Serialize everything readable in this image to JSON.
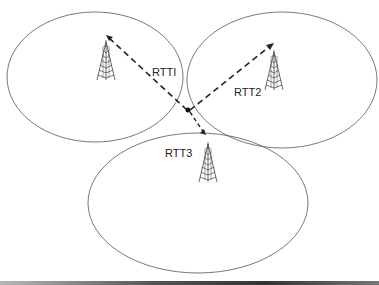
{
  "diagram": {
    "type": "trilateration",
    "labels": {
      "rtt1": "RTTI",
      "rtt2": "RTT2",
      "rtt3": "RTT3"
    },
    "colors": {
      "ellipse_stroke": "#555555",
      "dashed_line": "#222222",
      "tower": "#444444",
      "background": "#ffffff"
    },
    "elements": [
      {
        "id": "cell-tower-1",
        "label": "RTTI"
      },
      {
        "id": "cell-tower-2",
        "label": "RTT2"
      },
      {
        "id": "cell-tower-3",
        "label": "RTT3"
      },
      {
        "id": "user-device-intersection"
      }
    ]
  }
}
